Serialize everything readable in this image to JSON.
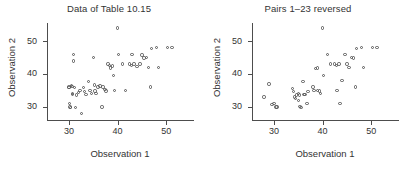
{
  "figure": {
    "width": 410,
    "height": 172,
    "background": "#ffffff",
    "marker_color": "#575757",
    "axis_color": "#4d4d4d",
    "text_color": "#333333"
  },
  "chart_data": [
    {
      "type": "scatter",
      "panel": "left",
      "title": "Data of Table 10.15",
      "xlabel": "Observation 1",
      "ylabel": "Observation 2",
      "xlim": [
        25.5,
        55.5
      ],
      "ylim": [
        26.0,
        55.5
      ],
      "xticks": [
        30,
        40,
        50
      ],
      "yticks": [
        30,
        40,
        50
      ],
      "xticklabels": [
        "30",
        "40",
        "50"
      ],
      "yticklabels": [
        "30",
        "40",
        "50"
      ],
      "grid": false,
      "legend": "none",
      "marker": "open-circle",
      "n_points": 52,
      "x": [
        30.0,
        30.0,
        30.1,
        30.2,
        30.3,
        30.5,
        30.6,
        30.7,
        30.8,
        31.0,
        31.0,
        31.2,
        31.4,
        31.6,
        32.0,
        32.3,
        32.6,
        33.0,
        33.2,
        33.5,
        34.0,
        34.3,
        34.6,
        35.0,
        35.2,
        35.4,
        35.6,
        36.0,
        36.4,
        36.8,
        37.0,
        37.4,
        37.6,
        38.0,
        38.4,
        38.6,
        39.0,
        39.2,
        39.4,
        40.0,
        40.2,
        41.0,
        41.6,
        42.4,
        42.8,
        43.0,
        43.4,
        44.0,
        44.6,
        45.0,
        45.4,
        46.0,
        46.4,
        46.8,
        47.0,
        48.0,
        48.4,
        50.2,
        51.2
      ],
      "y": [
        36.0,
        35.8,
        31.0,
        30.0,
        29.8,
        36.5,
        36.2,
        34.0,
        33.8,
        44.0,
        46.0,
        35.8,
        29.8,
        33.6,
        34.4,
        35.0,
        28.0,
        35.8,
        34.6,
        33.8,
        37.8,
        35.0,
        34.0,
        45.0,
        36.6,
        34.8,
        34.0,
        36.0,
        36.4,
        30.0,
        36.0,
        35.2,
        34.8,
        43.0,
        42.6,
        41.8,
        42.4,
        39.6,
        35.0,
        54.0,
        46.0,
        43.0,
        35.0,
        43.0,
        42.6,
        46.0,
        43.0,
        42.2,
        43.0,
        45.8,
        44.8,
        45.0,
        42.0,
        36.0,
        47.8,
        48.0,
        42.0,
        48.0,
        48.0
      ]
    },
    {
      "type": "scatter",
      "panel": "right",
      "title": "Pairs 1–23 reversed",
      "xlabel": "Observation 1",
      "ylabel": "Observation 2",
      "xlim": [
        25.5,
        55.5
      ],
      "ylim": [
        26.0,
        55.5
      ],
      "xticks": [
        30,
        40,
        50
      ],
      "yticks": [
        30,
        40,
        50
      ],
      "xticklabels": [
        "30",
        "40",
        "50"
      ],
      "yticklabels": [
        "30",
        "40",
        "50"
      ],
      "grid": false,
      "legend": "none",
      "marker": "open-circle",
      "n_points": 52,
      "x": [
        28.0,
        29.0,
        29.6,
        30.0,
        30.4,
        30.6,
        33.8,
        34.0,
        34.2,
        34.4,
        34.6,
        35.0,
        35.0,
        35.2,
        35.4,
        35.6,
        36.0,
        36.2,
        36.4,
        36.8,
        37.0,
        38.0,
        38.2,
        38.6,
        39.0,
        39.0,
        39.4,
        39.6,
        40.0,
        40.2,
        41.0,
        41.6,
        42.4,
        42.8,
        43.0,
        43.4,
        43.6,
        44.0,
        44.6,
        45.0,
        45.4,
        46.0,
        46.4,
        46.8,
        47.0,
        48.0,
        48.4,
        50.2,
        51.2
      ],
      "y": [
        33.0,
        37.0,
        30.8,
        31.0,
        30.0,
        30.0,
        35.6,
        34.6,
        33.0,
        32.6,
        33.6,
        34.0,
        32.0,
        33.6,
        30.2,
        29.8,
        37.8,
        33.8,
        33.8,
        31.0,
        34.6,
        36.0,
        35.0,
        41.6,
        41.8,
        35.0,
        34.8,
        34.0,
        54.0,
        39.6,
        46.0,
        43.0,
        43.0,
        42.6,
        35.0,
        43.0,
        31.0,
        38.0,
        46.0,
        43.0,
        42.0,
        45.0,
        44.8,
        36.0,
        47.8,
        48.0,
        42.0,
        48.0,
        48.0
      ]
    }
  ]
}
